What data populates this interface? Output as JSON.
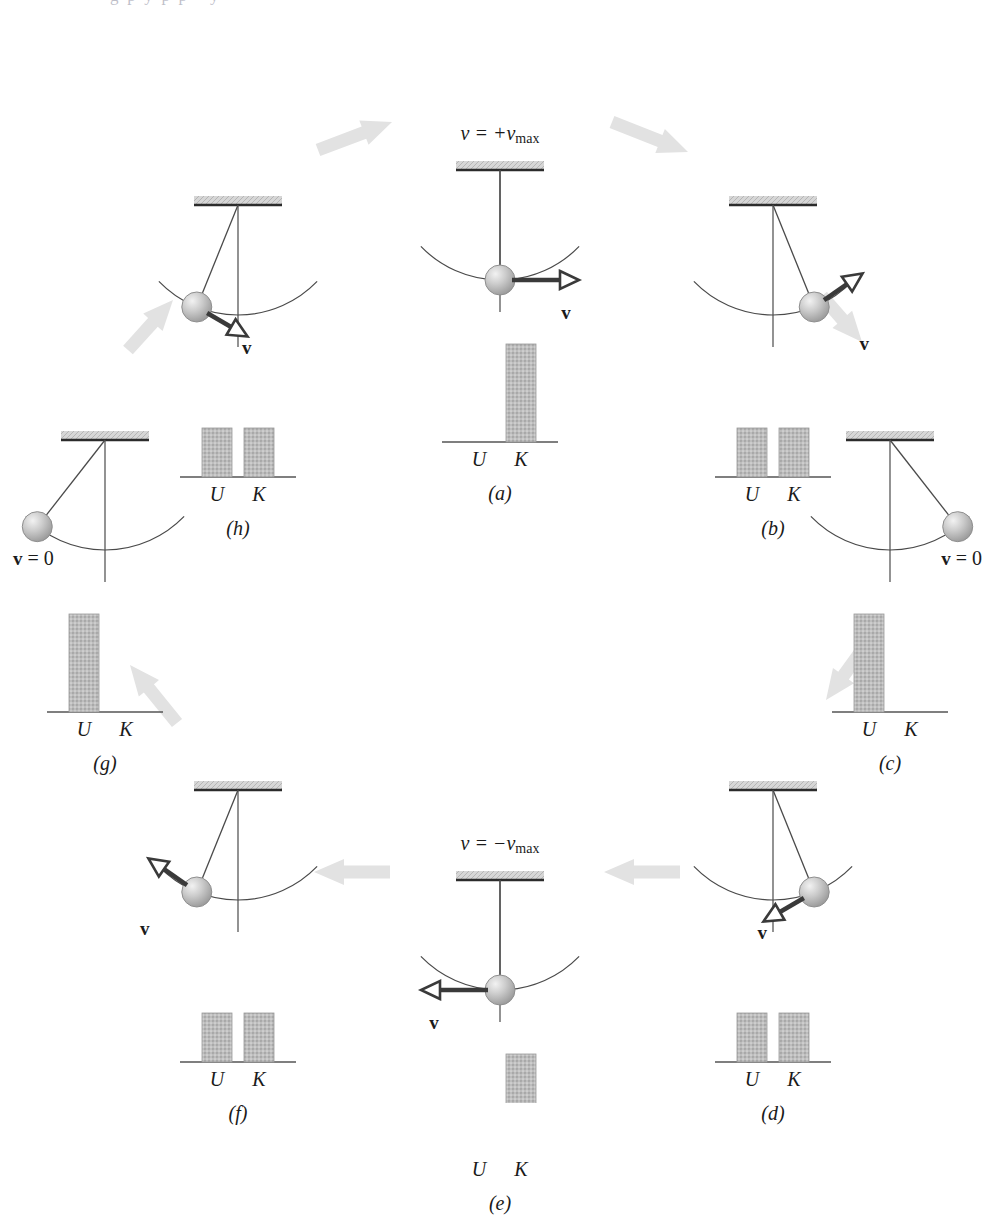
{
  "figure": {
    "kind": "pendulum-energy-cycle",
    "top_cropped_text": "g  p  y  p  p  -  y",
    "background": "#ffffff",
    "colors": {
      "bar_fill": "#b9b9b9",
      "bar_edge": "#9a9a9a",
      "flow_arrow": "#e2e2e2",
      "velocity_arrow": "#3a3a3a",
      "ceiling_fill": "#cfcfcf",
      "ceiling_edge": "#2b2b2b",
      "bob_fill": "#c0c0c0",
      "bob_edge": "#8f8f8f",
      "line": "#4a4a4a",
      "axis": "#555555",
      "text": "#1a1a1a"
    },
    "bar_axis_labels": [
      "U",
      "K"
    ]
  },
  "panels": [
    {
      "id": "a",
      "label": "(a)",
      "cx": 500,
      "cy": 170,
      "top_label": "v = +v",
      "top_label_sub": "max",
      "velocity_label": "v",
      "velocity_label_suffix": "",
      "bob_angle_deg": 0,
      "arrow_dir": "right",
      "bars": {
        "U": 0,
        "K": 100
      }
    },
    {
      "id": "b",
      "label": "(b)",
      "cx": 773,
      "cy": 205,
      "top_label": "",
      "top_label_sub": "",
      "velocity_label": "v",
      "velocity_label_suffix": "",
      "bob_angle_deg": 22,
      "arrow_dir": "up-right",
      "bars": {
        "U": 50,
        "K": 50
      }
    },
    {
      "id": "c",
      "label": "(c)",
      "cx": 890,
      "cy": 440,
      "top_label": "",
      "top_label_sub": "",
      "velocity_label": "v",
      "velocity_label_suffix": " = 0",
      "bob_angle_deg": 38,
      "arrow_dir": "none",
      "bars": {
        "U": 100,
        "K": 0
      }
    },
    {
      "id": "d",
      "label": "(d)",
      "cx": 773,
      "cy": 790,
      "top_label": "",
      "top_label_sub": "",
      "velocity_label": "v",
      "velocity_label_suffix": "",
      "bob_angle_deg": 22,
      "arrow_dir": "down-left",
      "bars": {
        "U": 50,
        "K": 50
      }
    },
    {
      "id": "e",
      "label": "(e)",
      "cx": 500,
      "cy": 880,
      "top_label": "v = −v",
      "top_label_sub": "max",
      "velocity_label": "v",
      "velocity_label_suffix": "",
      "bob_angle_deg": 0,
      "arrow_dir": "left",
      "bars": {
        "U": 0,
        "K": 100
      }
    },
    {
      "id": "f",
      "label": "(f)",
      "cx": 238,
      "cy": 790,
      "top_label": "",
      "top_label_sub": "",
      "velocity_label": "v",
      "velocity_label_suffix": "",
      "bob_angle_deg": -22,
      "arrow_dir": "up-left",
      "bars": {
        "U": 50,
        "K": 50
      }
    },
    {
      "id": "g",
      "label": "(g)",
      "cx": 105,
      "cy": 440,
      "top_label": "",
      "top_label_sub": "",
      "velocity_label": "v",
      "velocity_label_suffix": " = 0",
      "bob_angle_deg": -38,
      "arrow_dir": "none",
      "bars": {
        "U": 100,
        "K": 0
      }
    },
    {
      "id": "h",
      "label": "(h)",
      "cx": 238,
      "cy": 205,
      "top_label": "",
      "top_label_sub": "",
      "velocity_label": "v",
      "velocity_label_suffix": "",
      "bob_angle_deg": -22,
      "arrow_dir": "down-right",
      "bars": {
        "U": 50,
        "K": 50
      }
    }
  ],
  "flow_arrows": [
    {
      "from": "h",
      "to": "a",
      "x1": 318,
      "y1": 150,
      "x2": 392,
      "y2": 122
    },
    {
      "from": "a",
      "to": "b",
      "x1": 612,
      "y1": 122,
      "x2": 688,
      "y2": 152
    },
    {
      "from": "b",
      "to": "c",
      "x1": 822,
      "y1": 296,
      "x2": 862,
      "y2": 342
    },
    {
      "from": "c",
      "to": "d",
      "x1": 862,
      "y1": 650,
      "x2": 826,
      "y2": 700
    },
    {
      "from": "d",
      "to": "e",
      "x1": 680,
      "y1": 872,
      "x2": 604,
      "y2": 872
    },
    {
      "from": "e",
      "to": "f",
      "x1": 390,
      "y1": 872,
      "x2": 314,
      "y2": 872
    },
    {
      "from": "f",
      "to": "g",
      "x1": 177,
      "y1": 723,
      "x2": 130,
      "y2": 665
    },
    {
      "from": "g",
      "to": "h",
      "x1": 128,
      "y1": 350,
      "x2": 173,
      "y2": 300
    }
  ]
}
